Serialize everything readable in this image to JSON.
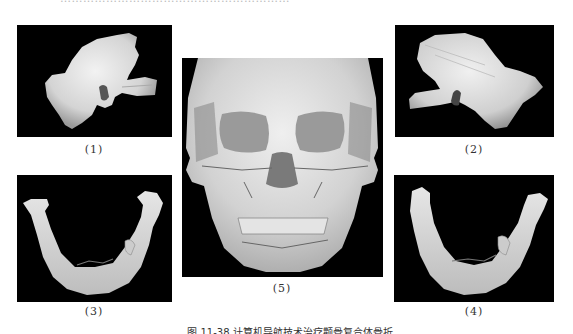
{
  "figure": {
    "top_cut_text": "……………………………………………………",
    "caption": "图 11-38 计算机导航技术治疗颧骨复合体骨折",
    "panels": [
      {
        "id": "1",
        "label": "(1)",
        "description": "3D CT reconstruction of zygomatic bone fragment, left view"
      },
      {
        "id": "2",
        "label": "(2)",
        "description": "3D CT reconstruction of zygomatic bone fragment, right view (mirrored)"
      },
      {
        "id": "3",
        "label": "(3)",
        "description": "3D CT reconstruction of mandible, view 1"
      },
      {
        "id": "4",
        "label": "(4)",
        "description": "3D CT reconstruction of mandible, view 2"
      },
      {
        "id": "5",
        "label": "(5)",
        "description": "3D CT reconstruction of full skull, frontal view with fracture lines"
      }
    ]
  },
  "colors": {
    "panel_background": "#000000",
    "bone": "#d9d9d9",
    "page_background": "#ffffff",
    "text": "#333333"
  }
}
